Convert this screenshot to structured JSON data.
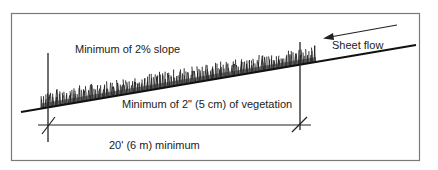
{
  "diagram": {
    "labels": {
      "slope": "Minimum of 2% slope",
      "sheet_flow": "Sheet flow",
      "vegetation": "Minimum of 2\" (5 cm) of vegetation",
      "length": "20' (6 m) minimum"
    },
    "colors": {
      "frame": "#7a7a7a",
      "line": "#111111",
      "vegetation": "#1a1a1a",
      "background": "#ffffff"
    }
  }
}
